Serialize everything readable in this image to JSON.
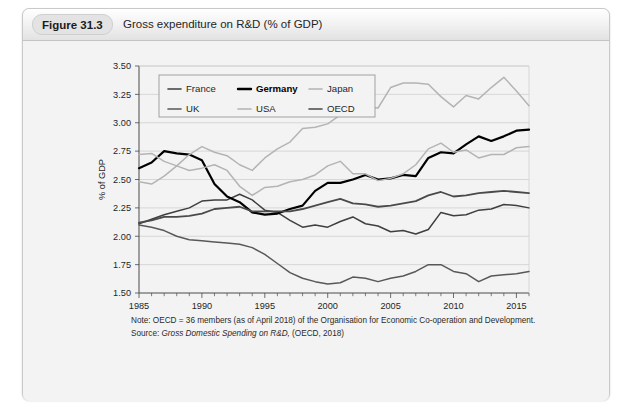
{
  "figure": {
    "badge": "Figure 31.3",
    "title": "Gross expenditure on R&D (% of GDP)"
  },
  "notes": {
    "note_label": "Note:",
    "note_text": "OECD  =  36 members (as of April 2018) of the Organisation for Economic Co-operation and Development.",
    "source_label": "Source:",
    "source_italic": "Gross Domestic Spending on R&D,",
    "source_rest": " (OECD, 2018)"
  },
  "chart_data": {
    "type": "line",
    "title": "Gross expenditure on R&D (% of GDP)",
    "xlabel": "",
    "ylabel": "% of GDP",
    "ylim": [
      1.5,
      3.5
    ],
    "ytick_step": 0.25,
    "yticks": [
      "1.50",
      "1.75",
      "2.00",
      "2.25",
      "2.50",
      "2.75",
      "3.00",
      "3.25",
      "3.50"
    ],
    "xlim": [
      1985,
      2016
    ],
    "xticks": [
      1985,
      1990,
      1995,
      2000,
      2005,
      2010,
      2015
    ],
    "xtick_labels": [
      "1985",
      "1990",
      "1995",
      "2000",
      "2005",
      "2010",
      "2015"
    ],
    "grid": "horizontal",
    "legend_position": "top-left-inside",
    "x": [
      1985,
      1986,
      1987,
      1988,
      1989,
      1990,
      1991,
      1992,
      1993,
      1994,
      1995,
      1996,
      1997,
      1998,
      1999,
      2000,
      2001,
      2002,
      2003,
      2004,
      2005,
      2006,
      2007,
      2008,
      2009,
      2010,
      2011,
      2012,
      2013,
      2014,
      2015,
      2016
    ],
    "series": [
      {
        "name": "France",
        "color": "#3f3f3f",
        "width": 1.5,
        "values": [
          2.11,
          2.15,
          2.19,
          2.22,
          2.25,
          2.31,
          2.32,
          2.32,
          2.37,
          2.32,
          2.23,
          2.21,
          2.14,
          2.08,
          2.1,
          2.08,
          2.13,
          2.17,
          2.11,
          2.09,
          2.04,
          2.05,
          2.02,
          2.06,
          2.21,
          2.18,
          2.19,
          2.23,
          2.24,
          2.28,
          2.27,
          2.25
        ]
      },
      {
        "name": "Germany",
        "color": "#000000",
        "width": 2.2,
        "values": [
          2.6,
          2.65,
          2.75,
          2.73,
          2.72,
          2.67,
          2.46,
          2.35,
          2.3,
          2.21,
          2.19,
          2.2,
          2.24,
          2.27,
          2.4,
          2.47,
          2.47,
          2.5,
          2.54,
          2.5,
          2.51,
          2.54,
          2.53,
          2.69,
          2.74,
          2.73,
          2.81,
          2.88,
          2.84,
          2.88,
          2.93,
          2.94
        ]
      },
      {
        "name": "Japan",
        "color": "#b4b4b4",
        "width": 1.5,
        "values": [
          2.48,
          2.46,
          2.53,
          2.62,
          2.72,
          2.79,
          2.74,
          2.71,
          2.63,
          2.58,
          2.69,
          2.77,
          2.83,
          2.95,
          2.96,
          2.99,
          3.07,
          3.12,
          3.14,
          3.13,
          3.31,
          3.35,
          3.35,
          3.34,
          3.23,
          3.14,
          3.24,
          3.21,
          3.31,
          3.4,
          3.28,
          3.15
        ]
      },
      {
        "name": "UK",
        "color": "#585858",
        "width": 1.5,
        "values": [
          2.1,
          2.08,
          2.05,
          2.0,
          1.97,
          1.96,
          1.95,
          1.94,
          1.93,
          1.9,
          1.84,
          1.76,
          1.68,
          1.63,
          1.6,
          1.58,
          1.59,
          1.64,
          1.63,
          1.6,
          1.63,
          1.65,
          1.69,
          1.75,
          1.75,
          1.69,
          1.67,
          1.6,
          1.65,
          1.66,
          1.67,
          1.69
        ]
      },
      {
        "name": "USA",
        "color": "#b4b4b4",
        "width": 1.5,
        "values": [
          2.72,
          2.73,
          2.66,
          2.62,
          2.58,
          2.6,
          2.63,
          2.58,
          2.44,
          2.36,
          2.43,
          2.44,
          2.48,
          2.5,
          2.54,
          2.62,
          2.66,
          2.55,
          2.55,
          2.49,
          2.51,
          2.55,
          2.63,
          2.77,
          2.82,
          2.74,
          2.76,
          2.69,
          2.72,
          2.72,
          2.78,
          2.79
        ]
      },
      {
        "name": "OECD",
        "color": "#4a4a4a",
        "width": 1.8,
        "values": [
          2.12,
          2.14,
          2.17,
          2.17,
          2.18,
          2.2,
          2.24,
          2.25,
          2.26,
          2.22,
          2.22,
          2.22,
          2.22,
          2.24,
          2.27,
          2.3,
          2.33,
          2.29,
          2.28,
          2.26,
          2.27,
          2.29,
          2.31,
          2.36,
          2.39,
          2.35,
          2.36,
          2.38,
          2.39,
          2.4,
          2.39,
          2.38
        ]
      }
    ],
    "legend_entries": [
      {
        "label": "France",
        "color": "#3f3f3f",
        "bold": false
      },
      {
        "label": "Germany",
        "color": "#000000",
        "bold": true
      },
      {
        "label": "Japan",
        "color": "#b4b4b4",
        "bold": false
      },
      {
        "label": "UK",
        "color": "#585858",
        "bold": false
      },
      {
        "label": "USA",
        "color": "#b4b4b4",
        "bold": false
      },
      {
        "label": "OECD",
        "color": "#4a4a4a",
        "bold": false
      }
    ]
  }
}
